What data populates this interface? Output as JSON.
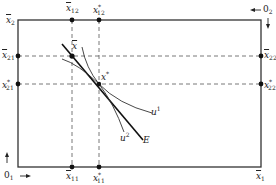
{
  "diagram": {
    "type": "edgeworth-box",
    "colors": {
      "line": "#333333",
      "dashed": "#555555",
      "point": "#111111",
      "background": "#ffffff"
    },
    "box": {
      "left": 18,
      "top": 20,
      "right": 261,
      "bottom": 167
    },
    "origins": {
      "o1": {
        "label": "0",
        "sub": "1"
      },
      "o2": {
        "label": "0",
        "sub": "2"
      }
    },
    "axis_labels": {
      "x1_bar": {
        "base": "x",
        "sub": "1"
      },
      "x2_bar": {
        "base": "x",
        "sub": "2"
      }
    },
    "points": {
      "endowment": {
        "base": "x",
        "sup": "",
        "label_text": "x̄"
      },
      "equilibrium": {
        "base": "x",
        "sup": "*",
        "label_text": "x*"
      }
    },
    "tick_labels": {
      "x12_bar": {
        "base": "x",
        "sub": "12"
      },
      "x12_star": {
        "base": "x",
        "sub": "12",
        "sup": "*"
      },
      "x21_bar": {
        "base": "x",
        "sub": "21"
      },
      "x21_star": {
        "base": "x",
        "sub": "21",
        "sup": "*"
      },
      "x22_bar": {
        "base": "x",
        "sub": "22"
      },
      "x22_star": {
        "base": "x",
        "sub": "22",
        "sup": "*"
      },
      "x11_bar": {
        "base": "x",
        "sub": "11"
      },
      "x11_star": {
        "base": "x",
        "sub": "11",
        "sup": "*"
      }
    },
    "curves": {
      "u1": {
        "base": "u",
        "sup": "1"
      },
      "u2": {
        "base": "u",
        "sup": "2"
      },
      "budget": {
        "label": "E"
      }
    }
  }
}
